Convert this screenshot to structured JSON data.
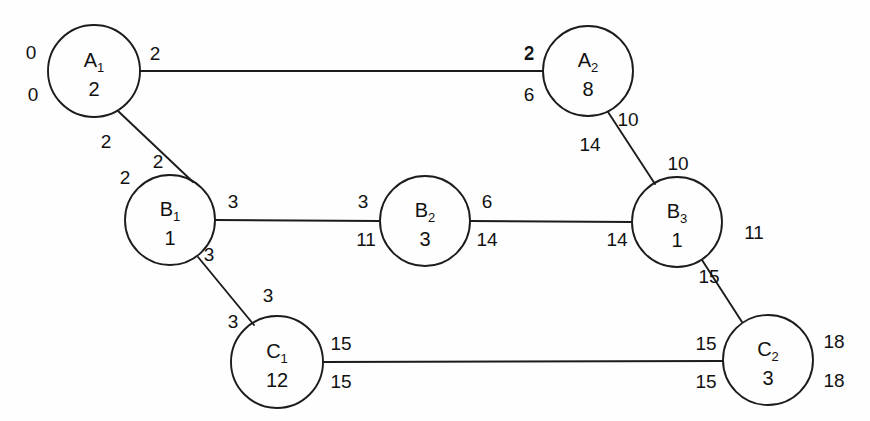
{
  "diagram": {
    "type": "activity-network-graph",
    "background_color": "#fefefe",
    "stroke_color": "#1c1c1c",
    "nodes": [
      {
        "id": "A1",
        "label": "A",
        "subscript": "1",
        "value": "2",
        "cx": 94,
        "cy": 71,
        "r": 46,
        "side_labels": [
          {
            "text": "0",
            "x": 31,
            "y": 59,
            "name": "a1-early-start"
          },
          {
            "text": "0",
            "x": 33,
            "y": 101,
            "name": "a1-late-start"
          }
        ]
      },
      {
        "id": "A2",
        "label": "A",
        "subscript": "2",
        "value": "8",
        "cx": 588,
        "cy": 71,
        "r": 45,
        "side_labels": [
          {
            "text": "2",
            "x": 529,
            "y": 59,
            "name": "a2-early-start"
          },
          {
            "text": "6",
            "x": 529,
            "y": 101,
            "name": "a2-late-start"
          }
        ]
      },
      {
        "id": "B1",
        "label": "B",
        "subscript": "1",
        "value": "1",
        "cx": 170,
        "cy": 220,
        "r": 45,
        "side_labels": []
      },
      {
        "id": "B2",
        "label": "B",
        "subscript": "2",
        "value": "3",
        "cx": 425,
        "cy": 221,
        "r": 45,
        "side_labels": []
      },
      {
        "id": "B3",
        "label": "B",
        "subscript": "3",
        "value": "1",
        "cx": 677,
        "cy": 222,
        "r": 45,
        "side_labels": []
      },
      {
        "id": "C1",
        "label": "C",
        "subscript": "1",
        "value": "12",
        "cx": 277,
        "cy": 362,
        "r": 46,
        "side_labels": []
      },
      {
        "id": "C2",
        "label": "C",
        "subscript": "2",
        "value": "3",
        "cx": 768,
        "cy": 360,
        "r": 45,
        "side_labels": [
          {
            "text": "18",
            "x": 834,
            "y": 348,
            "name": "c2-early-finish"
          },
          {
            "text": "18",
            "x": 834,
            "y": 387,
            "name": "c2-late-finish"
          }
        ]
      }
    ],
    "edges": [
      {
        "id": "A1-A2",
        "from": "A1",
        "to": "A2",
        "x1": 140,
        "y1": 71,
        "x2": 543,
        "y2": 71
      },
      {
        "id": "A1-B1",
        "from": "A1",
        "to": "B1",
        "x1": 118,
        "y1": 111,
        "x2": 193,
        "y2": 182
      },
      {
        "id": "B1-B2",
        "from": "B1",
        "to": "B2",
        "x1": 215,
        "y1": 220,
        "x2": 380,
        "y2": 221
      },
      {
        "id": "B2-B3",
        "from": "B2",
        "to": "B3",
        "x1": 470,
        "y1": 221,
        "x2": 632,
        "y2": 222
      },
      {
        "id": "A2-B3",
        "from": "A2",
        "to": "B3",
        "x1": 608,
        "y1": 112,
        "x2": 655,
        "y2": 184
      },
      {
        "id": "B1-C1",
        "from": "B1",
        "to": "C1",
        "x1": 198,
        "y1": 257,
        "x2": 254,
        "y2": 325
      },
      {
        "id": "B3-C2",
        "from": "B3",
        "to": "C2",
        "x1": 702,
        "y1": 260,
        "x2": 742,
        "y2": 322
      },
      {
        "id": "C1-C2",
        "from": "C1",
        "to": "C2",
        "x1": 323,
        "y1": 362,
        "x2": 723,
        "y2": 361
      }
    ],
    "edge_labels": [
      {
        "text": "2",
        "x": 155,
        "y": 60,
        "name": "edge-label-a1-a2-left"
      },
      {
        "text": "2",
        "x": 529,
        "y": 60,
        "name": "edge-label-a1-a2-right"
      },
      {
        "text": "2",
        "x": 106,
        "y": 148,
        "name": "edge-label-a1-b1-upper-left"
      },
      {
        "text": "2",
        "x": 158,
        "y": 168,
        "name": "edge-label-a1-b1-upper-right"
      },
      {
        "text": "2",
        "x": 125,
        "y": 184,
        "name": "edge-label-a1-b1-lower-left"
      },
      {
        "text": "3",
        "x": 233,
        "y": 208,
        "name": "edge-label-b1-b2-left"
      },
      {
        "text": "3",
        "x": 363,
        "y": 208,
        "name": "edge-label-b1-b2-right"
      },
      {
        "text": "11",
        "x": 366,
        "y": 246,
        "name": "edge-label-b2-left-late"
      },
      {
        "text": "6",
        "x": 487,
        "y": 208,
        "name": "edge-label-b2-b3-left"
      },
      {
        "text": "14",
        "x": 487,
        "y": 246,
        "name": "edge-label-b2-b3-left-late"
      },
      {
        "text": "14",
        "x": 617,
        "y": 246,
        "name": "edge-label-b2-b3-right-late"
      },
      {
        "text": "10",
        "x": 628,
        "y": 126,
        "name": "edge-label-a2-b3-upper"
      },
      {
        "text": "14",
        "x": 590,
        "y": 151,
        "name": "edge-label-a2-b3-left"
      },
      {
        "text": "10",
        "x": 678,
        "y": 170,
        "name": "edge-label-a2-b3-lower"
      },
      {
        "text": "11",
        "x": 754,
        "y": 239,
        "name": "edge-label-b3-c2-right"
      },
      {
        "text": "15",
        "x": 709,
        "y": 283,
        "name": "edge-label-b3-c2-lower"
      },
      {
        "text": "3",
        "x": 209,
        "y": 261,
        "name": "edge-label-b1-c1-upper"
      },
      {
        "text": "3",
        "x": 268,
        "y": 302,
        "name": "edge-label-b1-c1-right"
      },
      {
        "text": "3",
        "x": 233,
        "y": 328,
        "name": "edge-label-b1-c1-left"
      },
      {
        "text": "15",
        "x": 341,
        "y": 350,
        "name": "edge-label-c1-c2-left-early"
      },
      {
        "text": "15",
        "x": 341,
        "y": 388,
        "name": "edge-label-c1-c2-left-late"
      },
      {
        "text": "15",
        "x": 706,
        "y": 350,
        "name": "edge-label-c1-c2-right-early"
      },
      {
        "text": "15",
        "x": 706,
        "y": 388,
        "name": "edge-label-c1-c2-right-late"
      }
    ]
  }
}
